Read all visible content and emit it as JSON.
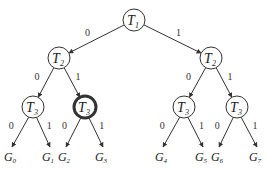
{
  "diagram": {
    "colors": {
      "stroke": "#333333",
      "text": "#222222",
      "background": "#ffffff"
    },
    "nodes": [
      {
        "id": "t1",
        "label": "T",
        "sub": "1",
        "x": 134,
        "y": 20,
        "bold": false
      },
      {
        "id": "t2a",
        "label": "T",
        "sub": "2",
        "x": 59,
        "y": 58,
        "bold": false
      },
      {
        "id": "t2b",
        "label": "T",
        "sub": "2",
        "x": 211,
        "y": 58,
        "bold": false
      },
      {
        "id": "t3a",
        "label": "T",
        "sub": "3",
        "x": 33,
        "y": 107,
        "bold": false
      },
      {
        "id": "t3b",
        "label": "T",
        "sub": "3",
        "x": 85,
        "y": 107,
        "bold": true
      },
      {
        "id": "t3c",
        "label": "T",
        "sub": "3",
        "x": 184,
        "y": 107,
        "bold": false
      },
      {
        "id": "t3d",
        "label": "T",
        "sub": "3",
        "x": 237,
        "y": 107,
        "bold": false
      }
    ],
    "leaves": [
      {
        "id": "g0",
        "label": "G",
        "sub": "0",
        "x": 12,
        "y": 157
      },
      {
        "id": "g1",
        "label": "G",
        "sub": "1",
        "x": 50,
        "y": 157
      },
      {
        "id": "g2",
        "label": "G",
        "sub": "2",
        "x": 66,
        "y": 157
      },
      {
        "id": "g3",
        "label": "G",
        "sub": "3",
        "x": 103,
        "y": 157
      },
      {
        "id": "g4",
        "label": "G",
        "sub": "4",
        "x": 163,
        "y": 157
      },
      {
        "id": "g5",
        "label": "G",
        "sub": "5",
        "x": 203,
        "y": 157
      },
      {
        "id": "g6",
        "label": "G",
        "sub": "6",
        "x": 219,
        "y": 157
      },
      {
        "id": "g7",
        "label": "G",
        "sub": "7",
        "x": 257,
        "y": 157
      }
    ],
    "edges": [
      {
        "from": "t1",
        "to": "t2a",
        "label": "0"
      },
      {
        "from": "t1",
        "to": "t2b",
        "label": "1"
      },
      {
        "from": "t2a",
        "to": "t3a",
        "label": "0"
      },
      {
        "from": "t2a",
        "to": "t3b",
        "label": "1"
      },
      {
        "from": "t2b",
        "to": "t3c",
        "label": "0"
      },
      {
        "from": "t2b",
        "to": "t3d",
        "label": "1"
      },
      {
        "from": "t3a",
        "to": "g0",
        "label": "0"
      },
      {
        "from": "t3a",
        "to": "g1",
        "label": "1"
      },
      {
        "from": "t3b",
        "to": "g2",
        "label": "0"
      },
      {
        "from": "t3b",
        "to": "g3",
        "label": "1"
      },
      {
        "from": "t3c",
        "to": "g4",
        "label": "0"
      },
      {
        "from": "t3c",
        "to": "g5",
        "label": "1"
      },
      {
        "from": "t3d",
        "to": "g6",
        "label": "0"
      },
      {
        "from": "t3d",
        "to": "g7",
        "label": "1"
      }
    ]
  }
}
